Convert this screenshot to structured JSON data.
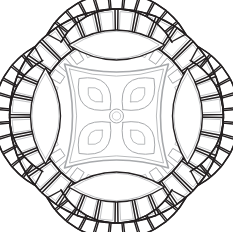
{
  "artwork": {
    "title": "Geometric Mandala Coloring Page",
    "subject": "circular rosette with four-petal flower",
    "background_color": "#ffffff",
    "canvas": {
      "width": 233,
      "height": 232
    },
    "center": {
      "x": 116.5,
      "y": 116
    }
  },
  "palette": {
    "outline_dark": "#231f20",
    "outline_mid": "#6d6e71",
    "outline_light": "#a7a9ac",
    "fill": "#ffffff"
  },
  "layers": {
    "outer_ring": {
      "name": "outer-segmented-ring",
      "outer_radius": 107,
      "inner_radius": 79,
      "segment_count": 32,
      "gap_degrees": 1.6,
      "inset": 2.6,
      "stroke_outer": "#231f20",
      "stroke_inner": "#a7a9ac",
      "stroke_width_outer": 1.5,
      "stroke_width_inner": 0.7
    },
    "arc_bands": {
      "name": "four-segmented-arc-bands",
      "count": 4,
      "rotations": [
        0,
        90,
        180,
        270
      ],
      "band_outer_radius": 79,
      "band_inner_radius": 63,
      "half_sweep_degrees": 62,
      "segment_count": 11,
      "gap_degrees": 1.4,
      "inset": 2.0,
      "arc_center_offset": 44,
      "stroke": "#231f20",
      "stroke_width": 1.4,
      "stroke_inner": "#a7a9ac",
      "stroke_width_inner": 0.7
    },
    "vesicas": {
      "name": "four-lens-shapes",
      "count": 4,
      "rotations": [
        0,
        90,
        180,
        270
      ],
      "half_length": 48,
      "half_width": 15,
      "distance_from_center": 71,
      "stroke": "#231f20",
      "stroke_width": 1.4,
      "inner_stroke": "#a7a9ac",
      "inner_stroke_width": 0.7,
      "inner_inset": 2.4
    },
    "center_panel": {
      "name": "concave-square-panel",
      "half_size": 52,
      "concavity": 16,
      "stroke": "#a7a9ac",
      "stroke_width": 1.6,
      "inner_offset": 5,
      "inner_stroke": "#bcbec0",
      "inner_stroke_width": 0.8
    },
    "flower": {
      "name": "four-petal-flower",
      "petal_count": 4,
      "petal_rotations": [
        45,
        135,
        225,
        315
      ],
      "petal_length": 44,
      "petal_width": 15,
      "petal_start": 9,
      "stroke": "#a7a9ac",
      "stroke_width": 1.0,
      "inner_petal_length": 20,
      "inner_petal_width": 6.5,
      "inner_petal_start": 20,
      "inner_stroke": "#bcbec0",
      "inner_stroke_width": 0.8,
      "hub_radius": 7,
      "hub_inner_radius": 4.2,
      "hub_stroke": "#a7a9ac",
      "hub_stroke_width": 1.0
    }
  }
}
